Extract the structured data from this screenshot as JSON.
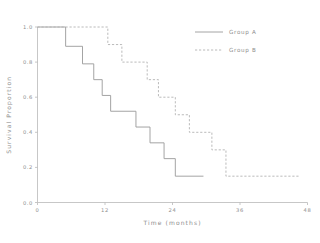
{
  "chart_data": {
    "type": "line",
    "title": "",
    "xlabel": "Time (months)",
    "ylabel": "Survival Proportion",
    "xlim": [
      0,
      48
    ],
    "ylim": [
      0,
      1.0
    ],
    "xticks": [
      "0",
      "12",
      "24",
      "36",
      "48"
    ],
    "xtick_values": [
      0,
      12,
      24,
      36,
      48
    ],
    "yticks": [
      "0.0",
      "0.2",
      "0.4",
      "0.6",
      "0.8",
      "1.0"
    ],
    "ytick_values": [
      0.0,
      0.2,
      0.4,
      0.6,
      0.8,
      1.0
    ],
    "grid": false,
    "legend_position": "top-right",
    "step_style": "post",
    "series": [
      {
        "name": "Group A",
        "style": "solid",
        "color": "#9a9a9a",
        "x": [
          0,
          5.0,
          5.0,
          8.0,
          8.0,
          10.0,
          10.0,
          11.5,
          11.5,
          13.0,
          13.0,
          17.5,
          17.5,
          20.0,
          20.0,
          22.5,
          22.5,
          24.5,
          24.5,
          29.5
        ],
        "y": [
          1.0,
          1.0,
          0.89,
          0.89,
          0.79,
          0.79,
          0.7,
          0.7,
          0.61,
          0.61,
          0.52,
          0.52,
          0.43,
          0.43,
          0.34,
          0.34,
          0.25,
          0.25,
          0.15,
          0.15
        ],
        "points": [
          {
            "t": 0,
            "s": 1.0
          },
          {
            "t": 5.0,
            "s": 0.89
          },
          {
            "t": 8.0,
            "s": 0.79
          },
          {
            "t": 10.0,
            "s": 0.7
          },
          {
            "t": 11.5,
            "s": 0.61
          },
          {
            "t": 13.0,
            "s": 0.52
          },
          {
            "t": 17.5,
            "s": 0.43
          },
          {
            "t": 20.0,
            "s": 0.34
          },
          {
            "t": 22.5,
            "s": 0.25
          },
          {
            "t": 24.5,
            "s": 0.15
          },
          {
            "t": 29.5,
            "s": 0.15
          }
        ]
      },
      {
        "name": "Group B",
        "style": "dashed",
        "color": "#b2b2b2",
        "x": [
          0,
          12.5,
          12.5,
          15.0,
          15.0,
          19.5,
          19.5,
          21.5,
          21.5,
          24.5,
          24.5,
          27.0,
          27.0,
          31.0,
          31.0,
          33.5,
          33.5,
          46.5
        ],
        "y": [
          1.0,
          1.0,
          0.9,
          0.9,
          0.8,
          0.8,
          0.7,
          0.7,
          0.6,
          0.6,
          0.5,
          0.5,
          0.4,
          0.4,
          0.3,
          0.3,
          0.15,
          0.15
        ],
        "points": [
          {
            "t": 0,
            "s": 1.0
          },
          {
            "t": 12.5,
            "s": 0.9
          },
          {
            "t": 15.0,
            "s": 0.8
          },
          {
            "t": 19.5,
            "s": 0.7
          },
          {
            "t": 21.5,
            "s": 0.6
          },
          {
            "t": 24.5,
            "s": 0.5
          },
          {
            "t": 27.0,
            "s": 0.4
          },
          {
            "t": 31.0,
            "s": 0.3
          },
          {
            "t": 33.5,
            "s": 0.15
          },
          {
            "t": 46.5,
            "s": 0.15
          }
        ]
      }
    ],
    "legend": [
      {
        "label": "Group A",
        "style": "solid"
      },
      {
        "label": "Group B",
        "style": "dashed"
      }
    ]
  },
  "colors": {
    "axis": "#b9b9b9",
    "text": "#8d8d8d",
    "group_a": "#9a9a9a",
    "group_b": "#b2b2b2",
    "background": "#ffffff"
  }
}
